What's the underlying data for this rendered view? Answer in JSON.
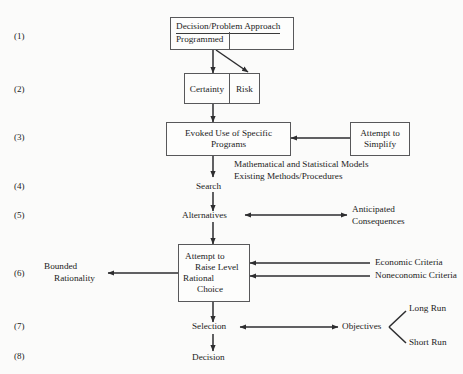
{
  "diagram": {
    "title": "",
    "row_labels": [
      "(1)",
      "(2)",
      "(3)",
      "(4)",
      "(5)",
      "(6)",
      "(7)",
      "(8)"
    ],
    "colors": {
      "stroke": "#58585a",
      "text": "#1c1c1c",
      "background": "#fbfbfa",
      "node_fill": "#fdfdfc"
    },
    "nodes": {
      "decision_problem": {
        "line1": "Decision/Problem Approach",
        "line2": "Programmed"
      },
      "certainty": "Certainty",
      "risk": "Risk",
      "evoked": {
        "line1": "Evoked Use of Specific",
        "line2": "Programs"
      },
      "attempt_simplify": {
        "line1": "Attempt to",
        "line2": "Simplify"
      },
      "models_note": {
        "line1": "Mathematical and Statistical Models",
        "line2": "Existing Methods/Procedures"
      },
      "search": "Search",
      "alternatives": "Alternatives",
      "anticipated": {
        "line1": "Anticipated",
        "line2": "Consequences"
      },
      "rational_choice": {
        "line1": "Attempt to",
        "line2": "Raise Level",
        "line3": "Rational",
        "line4": "Choice"
      },
      "bounded": {
        "line1": "Bounded",
        "line2": "Rationality"
      },
      "economic": "Economic Criteria",
      "noneconomic": "Noneconomic Criteria",
      "selection": "Selection",
      "objectives": "Objectives",
      "long_run": "Long Run",
      "short_run": "Short Run",
      "decision": "Decision"
    }
  }
}
